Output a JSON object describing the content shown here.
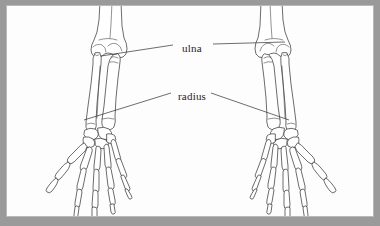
{
  "figure": {
    "kind": "anatomical-diagram",
    "background_color": "#9a9a9a",
    "paper_color": "#fdfdfd",
    "border_color": "#b9b9b9",
    "ink_color": "#3b3b3b"
  },
  "labels": [
    {
      "id": "ulna",
      "text": "ulna",
      "x": 175,
      "y": 36
    },
    {
      "id": "radius",
      "text": "radius",
      "x": 171,
      "y": 84
    }
  ],
  "leader_lines": [
    {
      "label": "ulna",
      "side": "left",
      "from_x": 172,
      "from_y": 45,
      "to_x": 100,
      "to_y": 55
    },
    {
      "label": "ulna",
      "side": "right",
      "from_x": 212,
      "from_y": 44,
      "to_x": 284,
      "to_y": 42
    },
    {
      "label": "radius",
      "side": "left",
      "from_x": 170,
      "from_y": 93,
      "to_x": 83,
      "to_y": 120
    },
    {
      "label": "radius",
      "side": "right",
      "from_x": 210,
      "from_y": 93,
      "to_x": 288,
      "to_y": 120
    }
  ],
  "structures": [
    {
      "name": "humerus",
      "count": 2
    },
    {
      "name": "ulna",
      "count": 2
    },
    {
      "name": "radius",
      "count": 2
    },
    {
      "name": "carpals",
      "count": 2
    },
    {
      "name": "metacarpals",
      "count": 2
    },
    {
      "name": "phalanges",
      "count": 2
    }
  ]
}
